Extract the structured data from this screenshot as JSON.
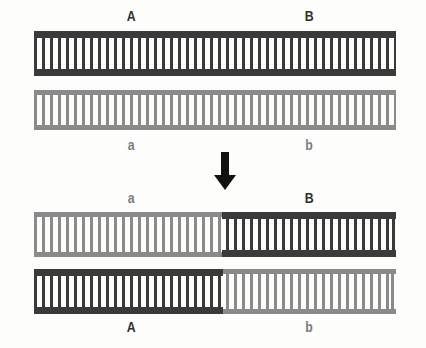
{
  "figure": {
    "type": "genetic-recombination-diagram",
    "background_color": "#fdfdfb",
    "colors": {
      "dark_chromosome": "#3a3a3a",
      "light_chromosome": "#8a8a8a",
      "arrow": "#111111",
      "dark_label_text": "#2f2f2f",
      "light_label_text": "#7d7d7d"
    },
    "geometry": {
      "track_left": 34,
      "track_right": 396,
      "crossover_x": 222
    }
  },
  "top_group": {
    "name": "parental-chromosomes",
    "labels_above": [
      {
        "text": "A",
        "tone": "dark",
        "x": 131,
        "y": 8
      },
      {
        "text": "B",
        "tone": "dark",
        "x": 309,
        "y": 8
      }
    ],
    "labels_below": [
      {
        "text": "a",
        "tone": "light",
        "x": 131,
        "y": 137
      },
      {
        "text": "b",
        "tone": "light",
        "x": 309,
        "y": 137
      }
    ],
    "chromosomes": [
      {
        "name": "chromosome-parental-1",
        "y": 31,
        "height": 45,
        "style": "dark",
        "segments": [
          {
            "tone": "dark",
            "start": 34,
            "end": 396,
            "allele": "A/B"
          }
        ]
      },
      {
        "name": "chromosome-parental-2",
        "y": 90,
        "height": 40,
        "style": "light",
        "segments": [
          {
            "tone": "light",
            "start": 34,
            "end": 396,
            "allele": "a/b"
          }
        ]
      }
    ]
  },
  "arrow": {
    "name": "process-arrow",
    "direction": "down",
    "x": 225,
    "y": 152,
    "width": 26,
    "height": 38,
    "shaft_height": 24
  },
  "bottom_group": {
    "name": "recombinant-chromosomes",
    "labels_above": [
      {
        "text": "a",
        "tone": "light",
        "x": 131,
        "y": 190
      },
      {
        "text": "B",
        "tone": "dark",
        "x": 309,
        "y": 190
      }
    ],
    "labels_below": [
      {
        "text": "A",
        "tone": "dark",
        "x": 131,
        "y": 319
      },
      {
        "text": "b",
        "tone": "light",
        "x": 309,
        "y": 319
      }
    ],
    "chromosomes": [
      {
        "name": "chromosome-recombinant-1",
        "y": 212,
        "height": 45,
        "style": "mixed",
        "segments": [
          {
            "tone": "light",
            "start": 34,
            "end": 222,
            "allele": "a"
          },
          {
            "tone": "dark",
            "start": 222,
            "end": 396,
            "allele": "B"
          }
        ]
      },
      {
        "name": "chromosome-recombinant-2",
        "y": 269,
        "height": 45,
        "style": "mixed",
        "segments": [
          {
            "tone": "dark",
            "start": 34,
            "end": 223,
            "allele": "A"
          },
          {
            "tone": "light",
            "start": 223,
            "end": 396,
            "allele": "b"
          }
        ]
      }
    ]
  }
}
